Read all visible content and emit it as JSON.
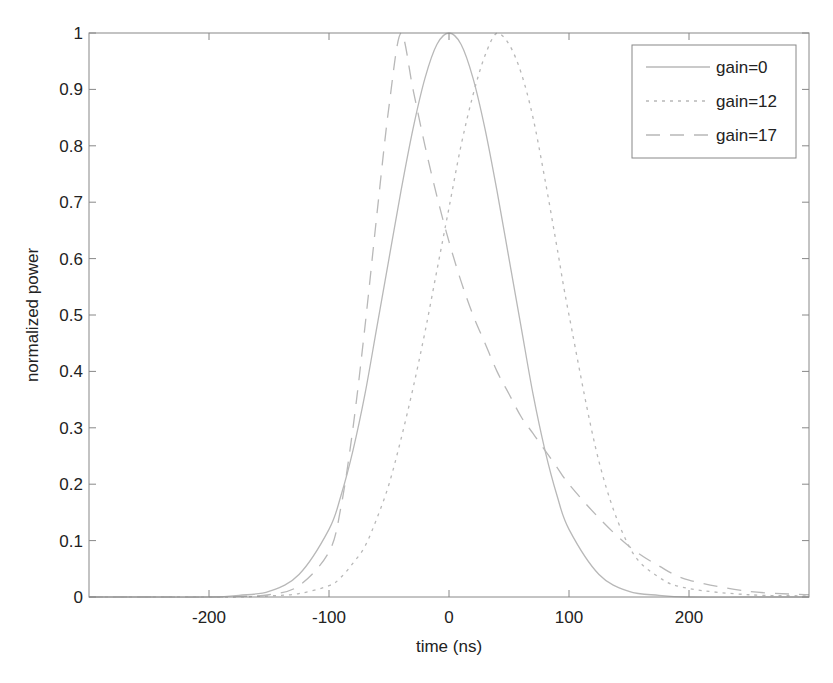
{
  "chart_data": {
    "type": "line",
    "title": "",
    "xlabel": "time (ns)",
    "ylabel": "normalized power",
    "xlim": [
      -300,
      300
    ],
    "ylim": [
      0,
      1
    ],
    "xticks": [
      -200,
      -100,
      0,
      100,
      200
    ],
    "xtick_labels": [
      "-200",
      "-100",
      "0",
      "100",
      "200"
    ],
    "yticks": [
      0,
      0.1,
      0.2,
      0.3,
      0.4,
      0.5,
      0.6,
      0.7,
      0.8,
      0.9,
      1
    ],
    "ytick_labels": [
      "0",
      "0.1",
      "0.2",
      "0.3",
      "0.4",
      "0.5",
      "0.6",
      "0.7",
      "0.8",
      "0.9",
      "1"
    ],
    "grid": false,
    "legend_position": "upper right",
    "x": [
      -300,
      -250,
      -200,
      -175,
      -150,
      -125,
      -100,
      -90,
      -80,
      -70,
      -60,
      -50,
      -40,
      -30,
      -20,
      -10,
      0,
      10,
      20,
      30,
      40,
      50,
      60,
      70,
      80,
      90,
      100,
      125,
      150,
      175,
      200,
      250,
      300
    ],
    "series": [
      {
        "name": "gain=0",
        "style": "solid",
        "values": [
          0,
          0,
          0.0,
          0.003,
          0.01,
          0.04,
          0.12,
          0.18,
          0.26,
          0.36,
          0.48,
          0.6,
          0.72,
          0.83,
          0.92,
          0.98,
          1.0,
          0.98,
          0.92,
          0.83,
          0.72,
          0.6,
          0.48,
          0.36,
          0.26,
          0.18,
          0.12,
          0.04,
          0.01,
          0.003,
          0.0,
          0,
          0
        ]
      },
      {
        "name": "gain=12",
        "style": "dotted",
        "values": [
          0,
          0,
          0,
          0.0,
          0.002,
          0.006,
          0.02,
          0.035,
          0.06,
          0.09,
          0.14,
          0.2,
          0.28,
          0.37,
          0.47,
          0.58,
          0.69,
          0.8,
          0.89,
          0.96,
          1.0,
          0.98,
          0.93,
          0.85,
          0.74,
          0.62,
          0.5,
          0.24,
          0.09,
          0.035,
          0.015,
          0.004,
          0.002
        ]
      },
      {
        "name": "gain=17",
        "style": "dashed",
        "values": [
          0,
          0,
          0,
          0.001,
          0.004,
          0.02,
          0.08,
          0.16,
          0.3,
          0.48,
          0.68,
          0.87,
          1.0,
          0.9,
          0.8,
          0.71,
          0.63,
          0.56,
          0.5,
          0.45,
          0.4,
          0.36,
          0.32,
          0.29,
          0.26,
          0.23,
          0.2,
          0.14,
          0.09,
          0.055,
          0.03,
          0.01,
          0.004
        ]
      }
    ]
  },
  "legend": {
    "items": [
      {
        "label": "gain=0",
        "style": "solid"
      },
      {
        "label": "gain=12",
        "style": "dotted"
      },
      {
        "label": "gain=17",
        "style": "dashed"
      }
    ]
  },
  "colors": {
    "axis": "#888888",
    "text": "#222222",
    "line": "#b8b8b8",
    "background": "#ffffff"
  }
}
